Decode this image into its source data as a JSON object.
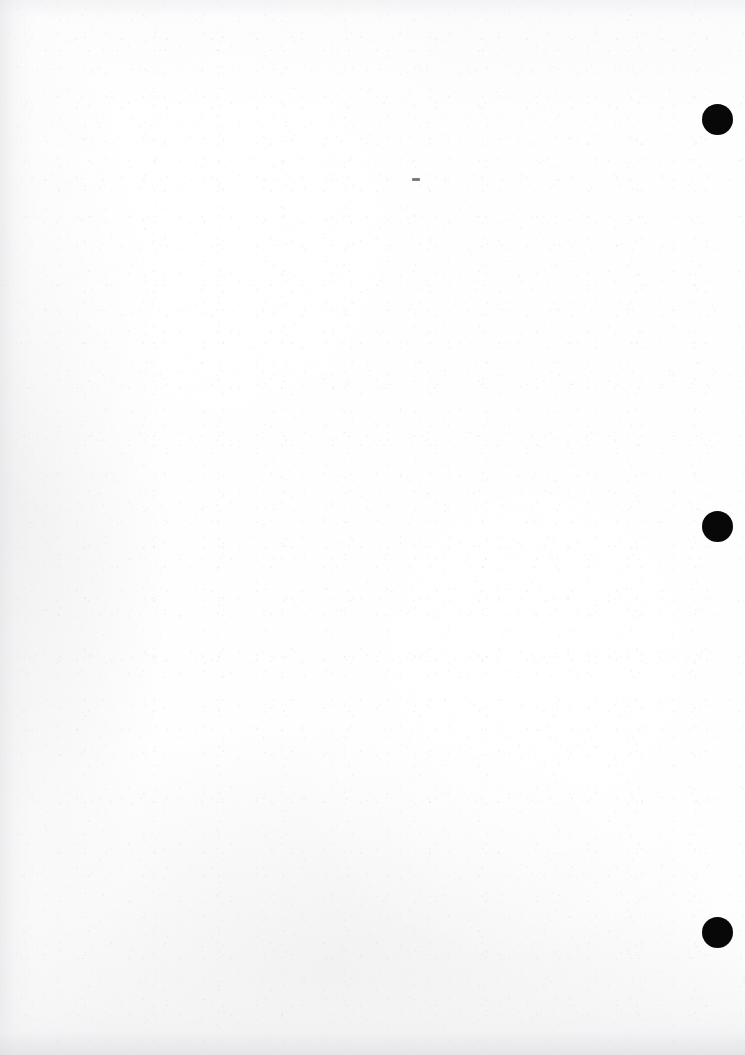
{
  "page": {
    "kind": "scanned-blank-page",
    "width": 745,
    "height": 1055,
    "background_color": "#fdfdfd",
    "content_text": "",
    "note": ""
  },
  "marks": {
    "dot_color": "#080808",
    "dot_diameter": 31,
    "registration_dots": [
      {
        "name": "registration-dot-top",
        "x": 702,
        "y": 104,
        "size": 31
      },
      {
        "name": "registration-dot-middle",
        "x": 702,
        "y": 511,
        "size": 31
      },
      {
        "name": "registration-dot-bottom",
        "x": 702,
        "y": 917,
        "size": 31
      }
    ],
    "specks": [
      {
        "name": "speck-upper-center",
        "x": 412,
        "y": 178,
        "w": 8,
        "h": 3
      }
    ]
  }
}
